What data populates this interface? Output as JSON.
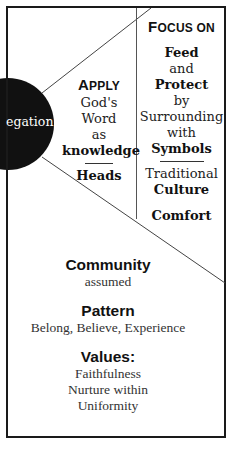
{
  "circle": {
    "label": "egation",
    "color": "#111111"
  },
  "apply": {
    "title_first": "A",
    "title_rest": "PPLY",
    "lines": [
      "God's",
      "Word",
      "as"
    ],
    "bold": "knowledge",
    "bottom": "Heads"
  },
  "focus": {
    "title_first": "F",
    "title_rest": "OCUS ON",
    "lines": [
      {
        "text": "Feed",
        "bold": true
      },
      {
        "text": "and",
        "bold": false
      },
      {
        "text": "Protect",
        "bold": true
      },
      {
        "text": "by",
        "bold": false
      },
      {
        "text": "Surrounding",
        "bold": false
      },
      {
        "text": "with",
        "bold": false
      },
      {
        "text": "Symbols",
        "bold": true
      }
    ],
    "after_rule": [
      {
        "text": "Traditional",
        "bold": false
      },
      {
        "text": "Culture",
        "bold": true
      }
    ],
    "last": "Comfort"
  },
  "bottom": {
    "community": {
      "heading": "Community",
      "sub": "assumed"
    },
    "pattern": {
      "heading": "Pattern",
      "sub": "Belong, Believe, Experience"
    },
    "values": {
      "heading": "Values:",
      "items": [
        "Faithfulness",
        "Nurture within",
        "Uniformity"
      ]
    }
  }
}
